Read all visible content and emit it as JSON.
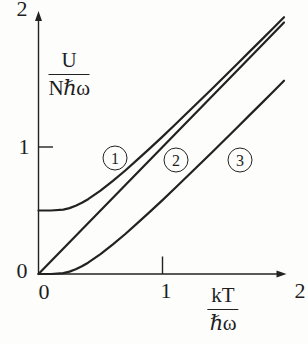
{
  "figure": {
    "y_tick_labels": {
      "zero": "0",
      "one": "1",
      "two": "2"
    },
    "x_tick_labels": {
      "zero": "0",
      "one": "1",
      "two": "2"
    },
    "y_axis_label": {
      "numerator": "U",
      "denominator": "Nℏω"
    },
    "x_axis_label": {
      "numerator": "kT",
      "denominator": "ℏω"
    },
    "curve_badges": {
      "c1": "1",
      "c2": "2",
      "c3": "3"
    }
  },
  "colors": {
    "ink": "#222222",
    "background": "#fdfdfc"
  },
  "chart_data": {
    "type": "line",
    "title": "",
    "xlabel": "kT/ℏω",
    "ylabel": "U/Nℏω",
    "xlim": [
      0,
      2
    ],
    "ylim": [
      0,
      2
    ],
    "x_ticks": [
      0,
      1,
      2
    ],
    "y_ticks": [
      0,
      1,
      2
    ],
    "grid": false,
    "legend": "circled numbers 1, 2, 3 placed beside curves",
    "series": [
      {
        "label": "1",
        "points": [
          [
            0,
            0.5
          ],
          [
            0.1,
            0.5
          ],
          [
            0.2,
            0.507
          ],
          [
            0.25,
            0.519
          ],
          [
            0.3,
            0.537
          ],
          [
            0.35,
            0.561
          ],
          [
            0.4,
            0.589
          ],
          [
            0.5,
            0.656
          ],
          [
            0.6,
            0.733
          ],
          [
            0.7,
            0.815
          ],
          [
            0.8,
            0.902
          ],
          [
            0.9,
            0.991
          ],
          [
            1.0,
            1.082
          ],
          [
            1.1,
            1.175
          ],
          [
            1.2,
            1.269
          ],
          [
            1.3,
            1.364
          ],
          [
            1.4,
            1.459
          ],
          [
            1.5,
            1.555
          ],
          [
            1.6,
            1.652
          ],
          [
            1.7,
            1.749
          ],
          [
            1.8,
            1.846
          ],
          [
            1.9,
            1.943
          ],
          [
            1.98,
            2.022
          ]
        ]
      },
      {
        "label": "2",
        "points": [
          [
            0,
            0
          ],
          [
            0.25,
            0.25
          ],
          [
            0.5,
            0.5
          ],
          [
            0.75,
            0.75
          ],
          [
            1.0,
            1.0
          ],
          [
            1.25,
            1.25
          ],
          [
            1.5,
            1.5
          ],
          [
            1.75,
            1.75
          ],
          [
            1.98,
            1.98
          ]
        ]
      },
      {
        "label": "3",
        "points": [
          [
            0,
            0
          ],
          [
            0.1,
            0.0
          ],
          [
            0.2,
            0.007
          ],
          [
            0.25,
            0.019
          ],
          [
            0.3,
            0.037
          ],
          [
            0.35,
            0.061
          ],
          [
            0.4,
            0.089
          ],
          [
            0.5,
            0.156
          ],
          [
            0.6,
            0.233
          ],
          [
            0.7,
            0.315
          ],
          [
            0.8,
            0.402
          ],
          [
            0.9,
            0.491
          ],
          [
            1.0,
            0.582
          ],
          [
            1.1,
            0.675
          ],
          [
            1.2,
            0.769
          ],
          [
            1.3,
            0.864
          ],
          [
            1.4,
            0.959
          ],
          [
            1.5,
            1.055
          ],
          [
            1.6,
            1.152
          ],
          [
            1.7,
            1.249
          ],
          [
            1.8,
            1.346
          ],
          [
            1.9,
            1.443
          ],
          [
            1.98,
            1.522
          ]
        ]
      }
    ]
  }
}
